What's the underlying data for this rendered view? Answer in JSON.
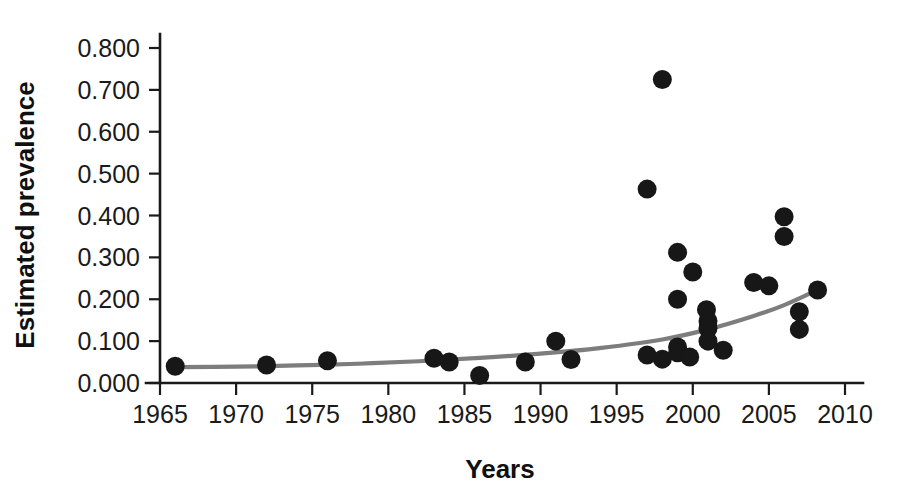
{
  "chart_data": {
    "type": "scatter",
    "title": "",
    "xlabel": "Years",
    "ylabel": "Estimated prevalence",
    "xlim": [
      1965,
      2010
    ],
    "ylim": [
      0.0,
      0.8
    ],
    "grid": false,
    "legend": null,
    "x_ticks": [
      1965,
      1970,
      1975,
      1980,
      1985,
      1990,
      1995,
      2000,
      2005,
      2010
    ],
    "x_tick_labels": [
      "1965",
      "1970",
      "1975",
      "1980",
      "1985",
      "1990",
      "1995",
      "2000",
      "2005",
      "2010"
    ],
    "y_ticks": [
      0.0,
      0.1,
      0.2,
      0.3,
      0.4,
      0.5,
      0.6,
      0.7,
      0.8
    ],
    "y_tick_labels": [
      "0.000",
      "0.100",
      "0.200",
      "0.300",
      "0.400",
      "0.500",
      "0.600",
      "0.700",
      "0.800"
    ],
    "marker": {
      "shape": "circle",
      "color": "#171717",
      "radius_px": 9.5
    },
    "points": [
      {
        "x": 1966.0,
        "y": 0.04
      },
      {
        "x": 1972.0,
        "y": 0.043
      },
      {
        "x": 1976.0,
        "y": 0.053
      },
      {
        "x": 1983.0,
        "y": 0.059
      },
      {
        "x": 1984.0,
        "y": 0.05
      },
      {
        "x": 1986.0,
        "y": 0.018
      },
      {
        "x": 1989.0,
        "y": 0.05
      },
      {
        "x": 1991.0,
        "y": 0.1
      },
      {
        "x": 1992.0,
        "y": 0.056
      },
      {
        "x": 1997.0,
        "y": 0.463
      },
      {
        "x": 1997.0,
        "y": 0.067
      },
      {
        "x": 1998.0,
        "y": 0.725
      },
      {
        "x": 1998.0,
        "y": 0.057
      },
      {
        "x": 1999.0,
        "y": 0.312
      },
      {
        "x": 1999.0,
        "y": 0.2
      },
      {
        "x": 1999.0,
        "y": 0.086
      },
      {
        "x": 1999.0,
        "y": 0.072
      },
      {
        "x": 1999.8,
        "y": 0.062
      },
      {
        "x": 2000.0,
        "y": 0.265
      },
      {
        "x": 2000.9,
        "y": 0.175
      },
      {
        "x": 2001.0,
        "y": 0.148
      },
      {
        "x": 2001.0,
        "y": 0.13
      },
      {
        "x": 2001.0,
        "y": 0.1
      },
      {
        "x": 2002.0,
        "y": 0.078
      },
      {
        "x": 2004.0,
        "y": 0.24
      },
      {
        "x": 2005.0,
        "y": 0.232
      },
      {
        "x": 2006.0,
        "y": 0.397
      },
      {
        "x": 2006.0,
        "y": 0.35
      },
      {
        "x": 2007.0,
        "y": 0.17
      },
      {
        "x": 2007.0,
        "y": 0.128
      },
      {
        "x": 2008.2,
        "y": 0.222
      }
    ],
    "trend_line": {
      "name": "exponential fit",
      "color": "#7d7d7d",
      "points": [
        {
          "x": 1966.0,
          "y": 0.038
        },
        {
          "x": 1970.0,
          "y": 0.039
        },
        {
          "x": 1974.0,
          "y": 0.042
        },
        {
          "x": 1978.0,
          "y": 0.046
        },
        {
          "x": 1982.0,
          "y": 0.052
        },
        {
          "x": 1986.0,
          "y": 0.06
        },
        {
          "x": 1990.0,
          "y": 0.07
        },
        {
          "x": 1994.0,
          "y": 0.084
        },
        {
          "x": 1998.0,
          "y": 0.104
        },
        {
          "x": 2001.0,
          "y": 0.128
        },
        {
          "x": 2004.0,
          "y": 0.16
        },
        {
          "x": 2006.0,
          "y": 0.186
        },
        {
          "x": 2008.3,
          "y": 0.224
        }
      ]
    }
  }
}
